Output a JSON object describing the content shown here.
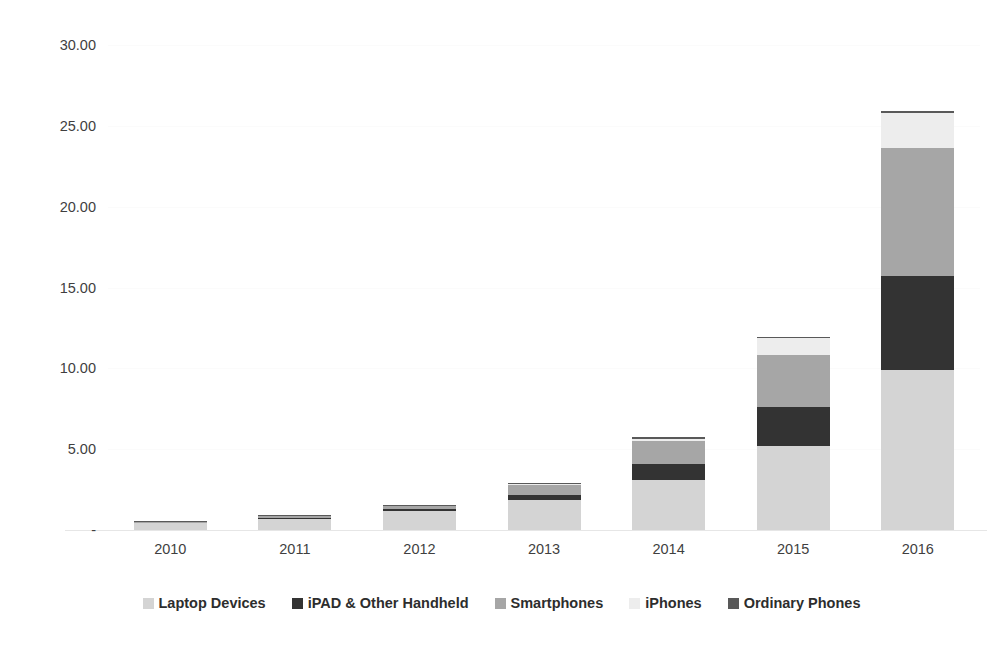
{
  "chart_data": {
    "type": "bar",
    "subtype": "stacked-column",
    "title": "",
    "subtitle": "",
    "xlabel": "",
    "ylabel": "",
    "categories": [
      "2010",
      "2011",
      "2012",
      "2013",
      "2014",
      "2015",
      "2016"
    ],
    "ytick_labels": [
      "-",
      "5.00",
      "10.00",
      "15.00",
      "20.00",
      "25.00",
      "30.00"
    ],
    "ytick_values": [
      0,
      5,
      10,
      15,
      20,
      25,
      30
    ],
    "ylim": [
      0,
      30
    ],
    "grid": true,
    "grid_axis": "y",
    "legend_position": "bottom",
    "series": [
      {
        "name": "Laptop Devices",
        "color": "#d4d4d4",
        "values": [
          0.45,
          0.7,
          1.2,
          1.85,
          3.1,
          5.2,
          9.9
        ]
      },
      {
        "name": "iPAD & Other Handheld",
        "color": "#333333",
        "values": [
          0.0,
          0.06,
          0.1,
          0.3,
          1.0,
          2.4,
          5.8
        ]
      },
      {
        "name": "Smartphones",
        "color": "#a6a6a6",
        "values": [
          0.05,
          0.1,
          0.2,
          0.65,
          1.4,
          3.2,
          7.9
        ]
      },
      {
        "name": "iPhones",
        "color": "#ededed",
        "values": [
          0.0,
          0.0,
          0.0,
          0.05,
          0.15,
          1.05,
          2.2
        ]
      },
      {
        "name": "Ordinary Phones",
        "color": "#595959",
        "values": [
          0.02,
          0.04,
          0.05,
          0.08,
          0.1,
          0.1,
          0.1
        ]
      }
    ],
    "totals": [
      0.52,
      0.9,
      1.55,
      2.93,
      5.75,
      11.95,
      25.9
    ]
  }
}
